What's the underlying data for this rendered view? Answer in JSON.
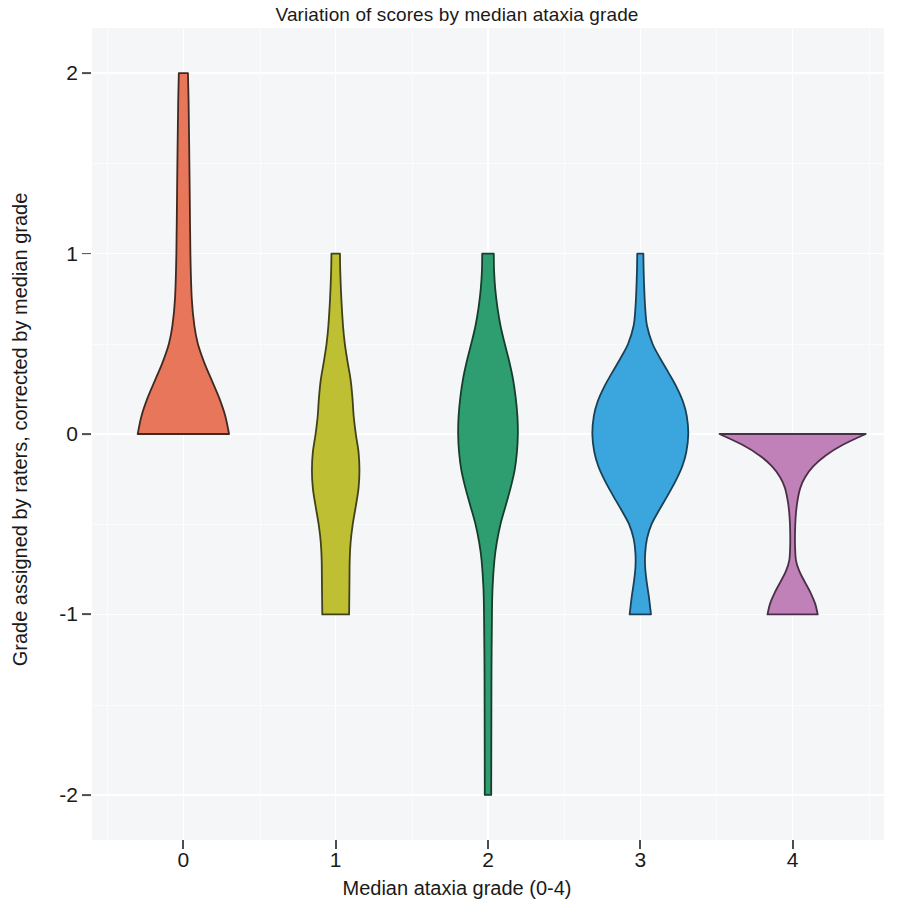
{
  "chart_data": {
    "type": "violin",
    "title": "Variation of scores by median ataxia grade",
    "xlabel": "Median ataxia grade (0-4)",
    "ylabel": "Grade assigned by raters, corrected by median grade",
    "x_categories": [
      "0",
      "1",
      "2",
      "3",
      "4"
    ],
    "x_tick_labels": [
      "0",
      "1",
      "2",
      "3",
      "4"
    ],
    "y_tick_labels": [
      "2",
      "1",
      "0",
      "-1",
      "-2"
    ],
    "y_tick_values": [
      2,
      1,
      0,
      -1,
      -2
    ],
    "ylim": [
      -2.25,
      2.25
    ],
    "xlim": [
      -0.6,
      4.6
    ],
    "grid": true,
    "legend": "none",
    "panel_background": "#f4f6f7",
    "series": [
      {
        "name": "Median grade 0",
        "category": "0",
        "color": "#e8765a",
        "outline": "#3f2a22",
        "data_min": 0,
        "data_max": 2,
        "mode": 0,
        "density_profile": [
          {
            "y": 2.0,
            "w": 0.03
          },
          {
            "y": 1.85,
            "w": 0.034
          },
          {
            "y": 1.6,
            "w": 0.038
          },
          {
            "y": 1.3,
            "w": 0.042
          },
          {
            "y": 1.0,
            "w": 0.046
          },
          {
            "y": 0.75,
            "w": 0.055
          },
          {
            "y": 0.6,
            "w": 0.072
          },
          {
            "y": 0.5,
            "w": 0.095
          },
          {
            "y": 0.4,
            "w": 0.135
          },
          {
            "y": 0.3,
            "w": 0.185
          },
          {
            "y": 0.2,
            "w": 0.235
          },
          {
            "y": 0.1,
            "w": 0.275
          },
          {
            "y": 0.0,
            "w": 0.3
          }
        ]
      },
      {
        "name": "Median grade 1",
        "category": "1",
        "color": "#bfbf34",
        "outline": "#41411a",
        "data_min": -1,
        "data_max": 1,
        "mode": -0.15,
        "density_profile": [
          {
            "y": 1.0,
            "w": 0.028
          },
          {
            "y": 0.9,
            "w": 0.03
          },
          {
            "y": 0.75,
            "w": 0.037
          },
          {
            "y": 0.6,
            "w": 0.048
          },
          {
            "y": 0.5,
            "w": 0.06
          },
          {
            "y": 0.4,
            "w": 0.078
          },
          {
            "y": 0.3,
            "w": 0.098
          },
          {
            "y": 0.2,
            "w": 0.11
          },
          {
            "y": 0.1,
            "w": 0.118
          },
          {
            "y": 0.0,
            "w": 0.132
          },
          {
            "y": -0.1,
            "w": 0.15
          },
          {
            "y": -0.2,
            "w": 0.156
          },
          {
            "y": -0.3,
            "w": 0.15
          },
          {
            "y": -0.4,
            "w": 0.132
          },
          {
            "y": -0.5,
            "w": 0.112
          },
          {
            "y": -0.6,
            "w": 0.098
          },
          {
            "y": -0.7,
            "w": 0.092
          },
          {
            "y": -0.85,
            "w": 0.09
          },
          {
            "y": -1.0,
            "w": 0.088
          }
        ]
      },
      {
        "name": "Median grade 2",
        "category": "2",
        "color": "#2e9e70",
        "outline": "#173d2c",
        "data_min": -2,
        "data_max": 1,
        "mode": 0.05,
        "density_profile": [
          {
            "y": 1.0,
            "w": 0.038
          },
          {
            "y": 0.9,
            "w": 0.04
          },
          {
            "y": 0.8,
            "w": 0.048
          },
          {
            "y": 0.7,
            "w": 0.062
          },
          {
            "y": 0.6,
            "w": 0.082
          },
          {
            "y": 0.5,
            "w": 0.11
          },
          {
            "y": 0.4,
            "w": 0.14
          },
          {
            "y": 0.3,
            "w": 0.165
          },
          {
            "y": 0.2,
            "w": 0.182
          },
          {
            "y": 0.1,
            "w": 0.193
          },
          {
            "y": 0.0,
            "w": 0.196
          },
          {
            "y": -0.1,
            "w": 0.19
          },
          {
            "y": -0.2,
            "w": 0.175
          },
          {
            "y": -0.3,
            "w": 0.148
          },
          {
            "y": -0.4,
            "w": 0.115
          },
          {
            "y": -0.5,
            "w": 0.082
          },
          {
            "y": -0.6,
            "w": 0.058
          },
          {
            "y": -0.7,
            "w": 0.042
          },
          {
            "y": -0.85,
            "w": 0.03
          },
          {
            "y": -1.0,
            "w": 0.026
          },
          {
            "y": -1.3,
            "w": 0.023
          },
          {
            "y": -1.6,
            "w": 0.022
          },
          {
            "y": -2.0,
            "w": 0.021
          }
        ]
      },
      {
        "name": "Median grade 3",
        "category": "3",
        "color": "#3ba6de",
        "outline": "#1b4055",
        "data_min": -1,
        "data_max": 1,
        "mode": 0.0,
        "density_profile": [
          {
            "y": 1.0,
            "w": 0.02
          },
          {
            "y": 0.9,
            "w": 0.022
          },
          {
            "y": 0.8,
            "w": 0.026
          },
          {
            "y": 0.7,
            "w": 0.032
          },
          {
            "y": 0.6,
            "w": 0.044
          },
          {
            "y": 0.5,
            "w": 0.08
          },
          {
            "y": 0.42,
            "w": 0.13
          },
          {
            "y": 0.34,
            "w": 0.185
          },
          {
            "y": 0.26,
            "w": 0.238
          },
          {
            "y": 0.18,
            "w": 0.28
          },
          {
            "y": 0.1,
            "w": 0.305
          },
          {
            "y": 0.0,
            "w": 0.315
          },
          {
            "y": -0.1,
            "w": 0.302
          },
          {
            "y": -0.18,
            "w": 0.275
          },
          {
            "y": -0.26,
            "w": 0.232
          },
          {
            "y": -0.34,
            "w": 0.18
          },
          {
            "y": -0.42,
            "w": 0.125
          },
          {
            "y": -0.5,
            "w": 0.074
          },
          {
            "y": -0.58,
            "w": 0.044
          },
          {
            "y": -0.66,
            "w": 0.032
          },
          {
            "y": -0.74,
            "w": 0.032
          },
          {
            "y": -0.82,
            "w": 0.042
          },
          {
            "y": -0.9,
            "w": 0.056
          },
          {
            "y": -1.0,
            "w": 0.07
          }
        ]
      },
      {
        "name": "Median grade 4",
        "category": "4",
        "color": "#c081b8",
        "outline": "#4b2f48",
        "data_min": -1,
        "data_max": 0,
        "mode": 0.0,
        "density_profile": [
          {
            "y": 0.0,
            "w": 0.48
          },
          {
            "y": -0.06,
            "w": 0.33
          },
          {
            "y": -0.12,
            "w": 0.215
          },
          {
            "y": -0.18,
            "w": 0.135
          },
          {
            "y": -0.24,
            "w": 0.082
          },
          {
            "y": -0.3,
            "w": 0.05
          },
          {
            "y": -0.38,
            "w": 0.03
          },
          {
            "y": -0.46,
            "w": 0.02
          },
          {
            "y": -0.54,
            "w": 0.016
          },
          {
            "y": -0.62,
            "w": 0.016
          },
          {
            "y": -0.7,
            "w": 0.022
          },
          {
            "y": -0.76,
            "w": 0.044
          },
          {
            "y": -0.82,
            "w": 0.08
          },
          {
            "y": -0.88,
            "w": 0.118
          },
          {
            "y": -0.94,
            "w": 0.148
          },
          {
            "y": -1.0,
            "w": 0.165
          }
        ]
      }
    ]
  }
}
